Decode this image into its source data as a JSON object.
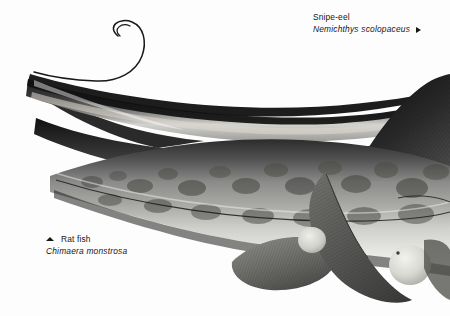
{
  "plate": {
    "background_color": "#fdfdfd",
    "width": 450,
    "height": 316,
    "medium": "monochrome scraperboard / halftone illustration"
  },
  "labels": {
    "snipe_eel": {
      "common_name": "Snipe-eel",
      "species_name": "Nemichthys scolopaceus",
      "marker_icon": "arrow-right-icon",
      "marker_direction": "right",
      "text_color": "#161616"
    },
    "rat_fish": {
      "common_name": "Rat fish",
      "species_name": "Chimaera monstrosa",
      "marker_icon": "arrow-up-icon",
      "marker_direction": "up",
      "text_color": "#161616"
    }
  },
  "subjects": [
    {
      "name": "snipe-eel",
      "description": "Extremely elongated ribbon-like eel with long beak-like jaws at left and a fine whip-thread tail curling into an S-loop at upper left.",
      "tone": "dark grey to black dorsal band with paler ventral stripe"
    },
    {
      "name": "rat-fish",
      "description": "Large chimaera filling the lower right, showing a mottled blotchy flank, tall dark triangular dorsal fin, broad ribbed pectoral fin, rounded pelvic fin and a large pale rounded eye near the snout.",
      "tone": "mid grey with dark mottling and light highlights"
    }
  ],
  "palette": {
    "ink_black": "#151515",
    "dark_grey": "#3a3a3a",
    "mid_grey": "#767676",
    "light_grey": "#b8b8b8",
    "highlight": "#e8e8e6",
    "paper": "#fdfdfd"
  }
}
